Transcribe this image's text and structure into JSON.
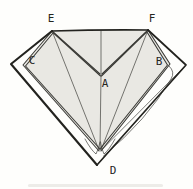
{
  "figure": {
    "colors": {
      "background": "#fefefc",
      "paper_fill": "#e9e8e3",
      "line": "#3a3a36",
      "heavy_line": "#23231f"
    },
    "labels": [
      {
        "id": "E",
        "text": "E",
        "x": 51,
        "y": 18
      },
      {
        "id": "F",
        "text": "F",
        "x": 152,
        "y": 18
      },
      {
        "id": "C",
        "text": "C",
        "x": 32,
        "y": 60
      },
      {
        "id": "B",
        "text": "B",
        "x": 159,
        "y": 61
      },
      {
        "id": "A",
        "text": "A",
        "x": 105,
        "y": 83
      },
      {
        "id": "D",
        "text": "D",
        "x": 113,
        "y": 170
      }
    ]
  }
}
